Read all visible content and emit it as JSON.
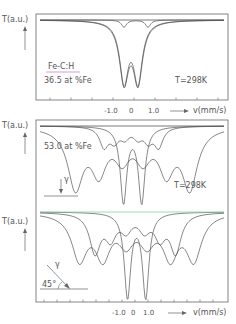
{
  "chart_data": [
    {
      "type": "line",
      "panel": "top",
      "title": "",
      "sample": "Fe-C:H",
      "composition": "36.5 at %Fe",
      "temperature": "T=298K",
      "ylabel": "T(a.u.)",
      "xlabel": "v(mm/s)",
      "xticks": [
        "-1.0",
        "0",
        "1.0"
      ],
      "xlim": [
        -3.0,
        3.0
      ],
      "ylim": [
        0,
        1
      ],
      "grid": false,
      "series": [
        {
          "name": "total fit",
          "kind": "doublet",
          "centers": [
            -0.3,
            0.4
          ],
          "depth": 0.92,
          "width": 0.55
        },
        {
          "name": "fit envelope",
          "kind": "doublet",
          "centers": [
            -0.3,
            0.4
          ],
          "depth": 0.9,
          "width": 0.52
        },
        {
          "name": "minor component",
          "kind": "doublet",
          "centers": [
            -0.3,
            0.9
          ],
          "depth": 0.1,
          "width": 0.3
        }
      ]
    },
    {
      "type": "line",
      "panel": "middle",
      "composition": "53.0 at %Fe",
      "temperature": "T=298K",
      "geometry": "gamma normal incidence",
      "gamma_label": "γ",
      "ylabel": "T(a.u.)",
      "xlim": [
        -3.0,
        3.0
      ],
      "ylim": [
        0,
        1
      ],
      "series": [
        {
          "name": "broad sextet",
          "kind": "sextet",
          "lines": [
            -2.1,
            -1.2,
            -0.3,
            0.5,
            1.4,
            2.3
          ],
          "depths": [
            0.85,
            0.6,
            0.4,
            0.4,
            0.6,
            0.85
          ],
          "width": 0.7
        },
        {
          "name": "inner sextet",
          "kind": "sextet",
          "lines": [
            -1.0,
            -0.6,
            -0.2,
            0.3,
            0.7,
            1.1
          ],
          "depths": [
            0.3,
            0.2,
            0.15,
            0.15,
            0.2,
            0.3
          ],
          "width": 0.4
        },
        {
          "name": "central doublet",
          "kind": "doublet",
          "centers": [
            -0.25,
            0.45
          ],
          "depth": 1.0,
          "width": 0.3
        }
      ]
    },
    {
      "type": "line",
      "panel": "bottom",
      "geometry": "gamma at 45°",
      "gamma_label": "γ",
      "angle_label": "45°",
      "ylabel": "T(a.u.)",
      "xlabel": "v(mm/s)",
      "xticks": [
        "-1.0",
        "0",
        "1.0"
      ],
      "xlim": [
        -3.0,
        3.0
      ],
      "ylim": [
        0,
        1
      ],
      "baseline_color": "#7fd4a8",
      "series": [
        {
          "name": "broad sextet",
          "kind": "sextet",
          "lines": [
            -2.1,
            -1.2,
            -0.3,
            0.5,
            1.4,
            2.3
          ],
          "depths": [
            0.6,
            0.55,
            0.35,
            0.35,
            0.55,
            0.6
          ],
          "width": 0.7
        },
        {
          "name": "second sextet",
          "kind": "sextet",
          "lines": [
            -1.5,
            -0.9,
            -0.3,
            0.4,
            1.0,
            1.6
          ],
          "depths": [
            0.5,
            0.3,
            0.2,
            0.2,
            0.3,
            0.5
          ],
          "width": 0.5
        },
        {
          "name": "central doublet",
          "kind": "doublet",
          "centers": [
            -0.25,
            0.45
          ],
          "depth": 1.0,
          "width": 0.3
        }
      ]
    }
  ],
  "labels": {
    "ylabel": "T(a.u.)",
    "xlabel": "v(mm/s)",
    "sample": "Fe-C:H",
    "comp1": "36.5  at  %Fe",
    "comp2": "53.0  at  %Fe",
    "temp": "T=298K",
    "gamma": "γ",
    "angle": "45°",
    "xtick_m1": "-1.0",
    "xtick_0": "0",
    "xtick_p1": "1.0"
  },
  "colors": {
    "ink": "#555555",
    "underline": "#d080c8",
    "baseline": "#7fd4a8"
  }
}
